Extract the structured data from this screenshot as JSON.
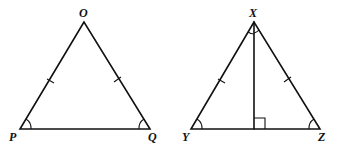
{
  "figures": [
    {
      "name": "triangle OPQ",
      "vertices": {
        "O": "O",
        "P": "P",
        "Q": "Q"
      },
      "marks": [
        "OP tick",
        "OQ tick",
        "angle P arc",
        "angle Q arc"
      ]
    },
    {
      "name": "triangle XYZ",
      "vertices": {
        "X": "X",
        "Y": "Y",
        "Z": "Z"
      },
      "marks": [
        "XY tick",
        "XZ tick",
        "angle Y arc",
        "angle Z arc",
        "angle X split arcs",
        "altitude from X with right angle"
      ]
    }
  ]
}
